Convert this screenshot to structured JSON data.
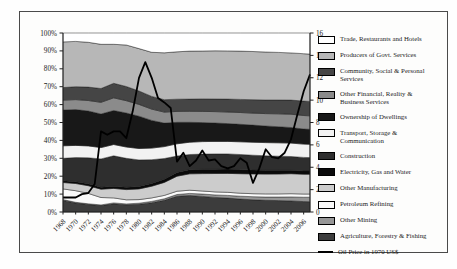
{
  "figure": {
    "kind": "100% stacked area chart of sectoral shares with oil price line overlay",
    "background_color": "#fdfdfc",
    "border_color": "#4a4a4a"
  },
  "axes": {
    "left": {
      "labels": [
        "0%",
        "10%",
        "20%",
        "30%",
        "40%",
        "50%",
        "60%",
        "70%",
        "80%",
        "90%",
        "100%"
      ],
      "min": 0,
      "max": 100
    },
    "right": {
      "labels": [
        "0",
        "2",
        "4",
        "6",
        "8",
        "10",
        "12",
        "14",
        "16"
      ],
      "min": 0,
      "max": 16
    },
    "x": {
      "labels": [
        "1968",
        "1970",
        "1972",
        "1974",
        "1976",
        "1978",
        "1980",
        "1982",
        "1984",
        "1986",
        "1988",
        "1990",
        "1992",
        "1994",
        "1996",
        "1998",
        "2000",
        "2002",
        "2004",
        "2006"
      ],
      "min": 1968,
      "max": 2007
    }
  },
  "legend": {
    "items": [
      {
        "label": "Trade, Restaurants and Hotels",
        "color": "#ffffff",
        "type": "area"
      },
      {
        "label": "Producers of Govt. Services",
        "color": "#b7b7b7",
        "type": "area"
      },
      {
        "label": "Community, Social & Personal Services",
        "color": "#454545",
        "type": "area"
      },
      {
        "label": "Other Financial, Reality & Business Services",
        "color": "#8b8b8b",
        "type": "area"
      },
      {
        "label": "Ownership of Dwellings",
        "color": "#181818",
        "type": "area"
      },
      {
        "label": "Transport, Storage & Communication",
        "color": "#f2f2f2",
        "type": "area"
      },
      {
        "label": "Construction",
        "color": "#2e2e2e",
        "type": "area"
      },
      {
        "label": "Electricity, Gas and Water",
        "color": "#0a0a0a",
        "type": "area"
      },
      {
        "label": "Other Manufacturing",
        "color": "#cccccc",
        "type": "area"
      },
      {
        "label": "Petroleum Refining",
        "color": "#fafafa",
        "type": "area"
      },
      {
        "label": "Other Mining",
        "color": "#969696",
        "type": "area"
      },
      {
        "label": "Agriculture, Forestry & Fishing",
        "color": "#3c3c3c",
        "type": "area"
      },
      {
        "label": "Oil Price in 1970 US$",
        "color": "#000000",
        "type": "line"
      }
    ]
  },
  "chart_data": {
    "type": "area",
    "stacking": "percent",
    "grid": false,
    "legend_position": "right",
    "x": [
      1968,
      1970,
      1972,
      1974,
      1976,
      1978,
      1980,
      1982,
      1984,
      1986,
      1988,
      1990,
      1992,
      1994,
      1996,
      1998,
      2000,
      2002,
      2004,
      2006,
      2007
    ],
    "series": [
      {
        "name": "Agriculture, Forestry & Fishing",
        "color": "#3c3c3c",
        "values": [
          6.5,
          5.0,
          4.2,
          3.6,
          4.6,
          4.0,
          4.3,
          5.2,
          6.5,
          8.8,
          9.3,
          8.8,
          8.2,
          7.8,
          7.2,
          6.8,
          6.5,
          6.3,
          6.1,
          5.8,
          5.7
        ]
      },
      {
        "name": "Other Mining",
        "color": "#969696",
        "values": [
          0.4,
          0.4,
          0.4,
          0.4,
          0.5,
          0.5,
          0.6,
          0.7,
          0.8,
          1.0,
          1.2,
          1.3,
          1.4,
          1.5,
          1.6,
          1.7,
          1.8,
          2.0,
          2.2,
          2.4,
          2.5
        ]
      },
      {
        "name": "Petroleum Refining",
        "color": "#fafafa",
        "values": [
          6.0,
          6.5,
          5.8,
          4.2,
          2.8,
          2.3,
          2.0,
          2.0,
          1.9,
          1.8,
          1.8,
          1.7,
          1.7,
          1.7,
          1.7,
          1.7,
          1.7,
          1.7,
          1.8,
          1.8,
          1.8
        ]
      },
      {
        "name": "Other Manufacturing",
        "color": "#cccccc",
        "values": [
          3.6,
          4.0,
          4.3,
          4.7,
          5.3,
          5.7,
          6.0,
          6.5,
          7.2,
          8.4,
          9.2,
          9.8,
          10.3,
          10.6,
          10.9,
          11.0,
          11.0,
          11.0,
          11.0,
          11.0,
          11.0
        ]
      },
      {
        "name": "Electricity, Gas and Water",
        "color": "#0a0a0a",
        "values": [
          1.0,
          1.0,
          1.1,
          1.1,
          1.2,
          1.3,
          1.4,
          1.6,
          1.8,
          2.1,
          2.3,
          2.4,
          2.4,
          2.4,
          2.3,
          2.2,
          2.1,
          2.0,
          1.9,
          1.8,
          1.8
        ]
      },
      {
        "name": "Construction",
        "color": "#2e2e2e",
        "values": [
          12.5,
          13.5,
          14.5,
          16.0,
          17.0,
          16.2,
          14.8,
          13.2,
          11.5,
          9.2,
          8.6,
          8.6,
          8.6,
          8.5,
          8.4,
          8.2,
          8.0,
          7.8,
          7.6,
          7.5,
          7.4
        ]
      },
      {
        "name": "Transport, Storage & Communication",
        "color": "#f2f2f2",
        "values": [
          7.0,
          6.8,
          6.6,
          6.4,
          6.3,
          6.3,
          6.4,
          6.5,
          6.6,
          6.8,
          6.9,
          7.0,
          7.0,
          7.0,
          7.1,
          7.2,
          7.3,
          7.4,
          7.4,
          7.4,
          7.4
        ]
      },
      {
        "name": "Ownership of Dwellings",
        "color": "#181818",
        "values": [
          20.0,
          20.0,
          19.5,
          19.0,
          19.0,
          19.0,
          18.0,
          15.5,
          13.0,
          12.0,
          11.2,
          10.7,
          10.3,
          10.0,
          9.8,
          9.5,
          9.2,
          8.9,
          8.6,
          8.4,
          8.3
        ]
      },
      {
        "name": "Other Financial, Reality & Business Services",
        "color": "#8b8b8b",
        "values": [
          5.5,
          5.6,
          5.9,
          6.6,
          7.1,
          6.9,
          6.6,
          6.3,
          6.1,
          6.1,
          6.2,
          6.3,
          6.4,
          6.5,
          6.6,
          6.7,
          6.9,
          7.1,
          7.3,
          7.5,
          7.5
        ]
      },
      {
        "name": "Community, Social & Personal Services",
        "color": "#454545",
        "values": [
          7.0,
          7.2,
          7.5,
          7.8,
          8.1,
          7.9,
          7.5,
          7.1,
          6.9,
          6.8,
          6.9,
          7.0,
          7.1,
          7.2,
          7.3,
          7.4,
          7.5,
          7.6,
          7.8,
          8.0,
          8.0
        ]
      },
      {
        "name": "Producers of Govt. Services",
        "color": "#b7b7b7",
        "values": [
          25.5,
          25.3,
          25.0,
          25.0,
          21.8,
          23.2,
          23.7,
          24.6,
          26.0,
          26.5,
          27.0,
          27.0,
          27.0,
          27.0,
          27.0,
          26.8,
          26.6,
          26.3,
          26.0,
          26.3,
          26.3
        ]
      },
      {
        "name": "Trade, Restaurants and Hotels",
        "color": "#ffffff",
        "values": [
          5.0,
          4.7,
          5.2,
          6.4,
          6.3,
          6.7,
          8.7,
          10.8,
          11.0,
          10.5,
          10.2,
          10.1,
          10.0,
          10.0,
          10.1,
          10.3,
          10.5,
          10.7,
          11.0,
          11.5,
          11.7
        ]
      }
    ],
    "line_series": {
      "name": "Oil Price in 1970 US$",
      "axis": "right",
      "color": "#000000",
      "x": [
        1968,
        1969,
        1970,
        1971,
        1972,
        1973,
        1974,
        1975,
        1976,
        1977,
        1978,
        1979,
        1980,
        1981,
        1982,
        1983,
        1984,
        1985,
        1986,
        1987,
        1988,
        1989,
        1990,
        1991,
        1992,
        1993,
        1994,
        1995,
        1996,
        1997,
        1998,
        1999,
        2000,
        2001,
        2002,
        2003,
        2004,
        2005,
        2006,
        2007
      ],
      "values": [
        1.3,
        1.3,
        1.3,
        1.6,
        1.7,
        2.5,
        7.2,
        6.9,
        7.2,
        7.2,
        6.6,
        9.0,
        12.0,
        13.4,
        12.0,
        10.2,
        9.8,
        9.3,
        4.5,
        5.3,
        4.1,
        4.6,
        5.5,
        4.6,
        4.7,
        4.1,
        3.9,
        4.1,
        4.8,
        4.4,
        2.6,
        3.9,
        5.6,
        4.9,
        4.8,
        5.3,
        6.5,
        8.7,
        10.8,
        12.3
      ]
    },
    "ylim_left": [
      0,
      100
    ],
    "ylim_right": [
      0,
      16
    ],
    "title": ""
  }
}
